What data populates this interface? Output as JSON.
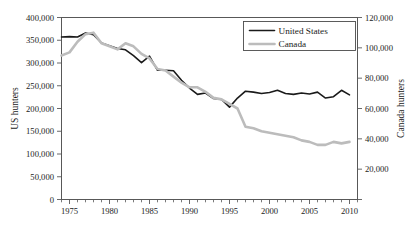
{
  "chart_data": {
    "type": "line",
    "title": "",
    "subtitle": "",
    "xlabel": "",
    "ylabel": "US hunters",
    "y2label": "Canada hunters",
    "grid": false,
    "legend_position": "top-right",
    "xlim": [
      1974,
      2011
    ],
    "ylim": [
      0,
      400000
    ],
    "y2lim": [
      0,
      120000
    ],
    "x_tick_labels": [
      "1975",
      "1980",
      "1985",
      "1990",
      "1995",
      "2000",
      "2005",
      "2010"
    ],
    "x_tick_values": [
      1975,
      1980,
      1985,
      1990,
      1995,
      2000,
      2005,
      2010
    ],
    "x_minor_tick_step": 1,
    "y_tick_labels": [
      "0",
      "50,000",
      "100,000",
      "150,000",
      "200,000",
      "250,000",
      "300,000",
      "350,000",
      "400,000"
    ],
    "y_tick_values": [
      0,
      50000,
      100000,
      150000,
      200000,
      250000,
      300000,
      350000,
      400000
    ],
    "y2_tick_labels": [
      "",
      "20,000",
      "40,000",
      "60,000",
      "80,000",
      "100,000",
      "120,000"
    ],
    "y2_tick_values": [
      0,
      20000,
      40000,
      60000,
      80000,
      100000,
      120000
    ],
    "x": [
      1974,
      1975,
      1976,
      1977,
      1978,
      1979,
      1980,
      1981,
      1982,
      1983,
      1984,
      1985,
      1986,
      1987,
      1988,
      1989,
      1990,
      1991,
      1992,
      1993,
      1994,
      1995,
      1996,
      1997,
      1998,
      1999,
      2000,
      2001,
      2002,
      2003,
      2004,
      2005,
      2006,
      2007,
      2008,
      2009,
      2010
    ],
    "series": [
      {
        "name": "United States",
        "axis": "left",
        "color": "#1a1a1a",
        "width": 1.6,
        "values": [
          357000,
          358000,
          357000,
          366000,
          362000,
          344000,
          338000,
          332000,
          329000,
          316000,
          301000,
          315000,
          284000,
          284000,
          283000,
          262000,
          245000,
          231000,
          234000,
          222000,
          220000,
          203000,
          223000,
          238000,
          236000,
          233000,
          235000,
          240000,
          233000,
          231000,
          234000,
          232000,
          236000,
          223000,
          226000,
          240000,
          230000
        ]
      },
      {
        "name": "Canada",
        "axis": "right",
        "color": "#bcbcbc",
        "width": 2.6,
        "values": [
          95000,
          97000,
          104000,
          109000,
          110000,
          103000,
          101000,
          99000,
          103000,
          101000,
          96000,
          93000,
          86000,
          85000,
          81000,
          77000,
          74000,
          74000,
          71000,
          67000,
          66000,
          63000,
          60000,
          48000,
          47000,
          45000,
          44000,
          43000,
          42000,
          41000,
          39000,
          38000,
          36000,
          36000,
          38000,
          37000,
          38000
        ]
      }
    ]
  }
}
